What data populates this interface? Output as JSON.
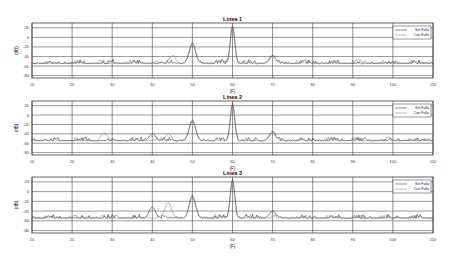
{
  "figure": {
    "x_axis_label": "(F)",
    "y_axis_label": "(dB)"
  },
  "legend": {
    "items": [
      {
        "label": "Sin Falla",
        "color": "#1a1a1a"
      },
      {
        "label": "Con Falla",
        "color": "#777777"
      }
    ]
  },
  "chart_data": [
    {
      "type": "line",
      "title": "Linea 1",
      "xlabel": "(F)",
      "ylabel": "(dB)",
      "xlim": [
        10,
        110
      ],
      "ylim": [
        -85,
        30
      ],
      "xticks": [
        10,
        20,
        30,
        40,
        50,
        60,
        70,
        80,
        90,
        100,
        110
      ],
      "yticks": [
        20,
        0,
        -20,
        -40,
        -60,
        -80
      ],
      "grid": true,
      "legend_position": "upper right",
      "noise_floor_db": -55,
      "series": [
        {
          "name": "Sin Falla",
          "peaks": [
            {
              "x": 50,
              "y": -12
            },
            {
              "x": 60,
              "y": 25
            },
            {
              "x": 70,
              "y": -38
            }
          ]
        },
        {
          "name": "Con Falla",
          "peaks": [
            {
              "x": 45,
              "y": -38
            },
            {
              "x": 50,
              "y": -15
            },
            {
              "x": 60,
              "y": 22
            },
            {
              "x": 70,
              "y": -40
            }
          ]
        }
      ]
    },
    {
      "type": "line",
      "title": "Linea 2",
      "xlabel": "(F)",
      "ylabel": "(dB)",
      "xlim": [
        10,
        110
      ],
      "ylim": [
        -85,
        30
      ],
      "xticks": [
        10,
        20,
        30,
        40,
        50,
        60,
        70,
        80,
        90,
        100,
        110
      ],
      "yticks": [
        20,
        0,
        -20,
        -40,
        -60,
        -80
      ],
      "grid": true,
      "legend_position": "upper right",
      "noise_floor_db": -55,
      "series": [
        {
          "name": "Sin Falla",
          "peaks": [
            {
              "x": 40,
              "y": -40
            },
            {
              "x": 50,
              "y": -10
            },
            {
              "x": 60,
              "y": 25
            },
            {
              "x": 70,
              "y": -35
            }
          ]
        },
        {
          "name": "Con Falla",
          "peaks": [
            {
              "x": 28,
              "y": -38
            },
            {
              "x": 44,
              "y": -40
            },
            {
              "x": 50,
              "y": -14
            },
            {
              "x": 60,
              "y": 22
            },
            {
              "x": 70,
              "y": -38
            }
          ]
        }
      ]
    },
    {
      "type": "line",
      "title": "Linea 3",
      "xlabel": "(F)",
      "ylabel": "(dB)",
      "xlim": [
        10,
        110
      ],
      "ylim": [
        -85,
        30
      ],
      "xticks": [
        10,
        20,
        30,
        40,
        50,
        60,
        70,
        80,
        90,
        100,
        110
      ],
      "yticks": [
        20,
        0,
        -20,
        -40,
        -60,
        -80
      ],
      "grid": true,
      "legend_position": "upper right",
      "noise_floor_db": -55,
      "series": [
        {
          "name": "Sin Falla",
          "peaks": [
            {
              "x": 40,
              "y": -32
            },
            {
              "x": 50,
              "y": -8
            },
            {
              "x": 60,
              "y": 25
            },
            {
              "x": 70,
              "y": -40
            }
          ]
        },
        {
          "name": "Con Falla",
          "peaks": [
            {
              "x": 44,
              "y": -22
            },
            {
              "x": 50,
              "y": -12
            },
            {
              "x": 60,
              "y": 22
            }
          ]
        }
      ]
    }
  ]
}
